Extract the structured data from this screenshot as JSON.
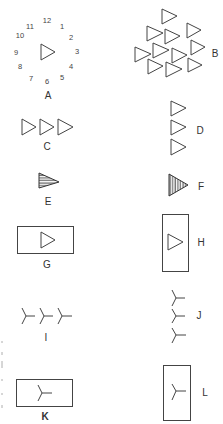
{
  "figure": {
    "panels": [
      {
        "id": "A",
        "label": "A",
        "description": "single triangle surrounded by clock-face numerals"
      },
      {
        "id": "B",
        "label": "B",
        "description": "cluster of 11 triangles"
      },
      {
        "id": "C",
        "label": "C",
        "description": "three triangles in a horizontal row"
      },
      {
        "id": "D",
        "label": "D",
        "description": "three triangles in a vertical column"
      },
      {
        "id": "E",
        "label": "E",
        "description": "triangle filled with horizontal stripes"
      },
      {
        "id": "F",
        "label": "F",
        "description": "triangle filled with vertical stripes"
      },
      {
        "id": "G",
        "label": "G",
        "description": "triangle inside a horizontal rectangle"
      },
      {
        "id": "H",
        "label": "H",
        "description": "triangle inside a vertical rectangle"
      },
      {
        "id": "I",
        "label": "I",
        "description": "three Y-shaped symbols in a horizontal row"
      },
      {
        "id": "J",
        "label": "J",
        "description": "three Y-shaped symbols in a vertical column"
      },
      {
        "id": "K",
        "label": "K",
        "description": "Y-shaped symbol inside a horizontal rectangle"
      },
      {
        "id": "L",
        "label": "L",
        "description": "Y-shaped symbol inside a vertical rectangle"
      }
    ],
    "clock_numerals": [
      "12",
      "1",
      "2",
      "3",
      "4",
      "5",
      "6",
      "7",
      "8",
      "9",
      "10",
      "11"
    ]
  }
}
